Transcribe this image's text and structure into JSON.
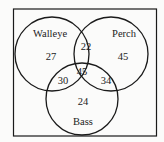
{
  "diagram": {
    "type": "venn-3",
    "sets": [
      {
        "name": "Walleye",
        "only": "27"
      },
      {
        "name": "Perch",
        "only": "45"
      },
      {
        "name": "Bass",
        "only": "24"
      }
    ],
    "labels": {
      "walleye": "Walleye",
      "perch": "Perch",
      "bass": "Bass"
    },
    "regions": {
      "walleye_only": "27",
      "perch_only": "45",
      "bass_only": "24",
      "walleye_perch": "22",
      "walleye_bass": "30",
      "perch_bass": "34",
      "all_three": "45"
    },
    "colors": {
      "stroke": "#1a1a1a",
      "background": "#fbfbfa"
    }
  }
}
